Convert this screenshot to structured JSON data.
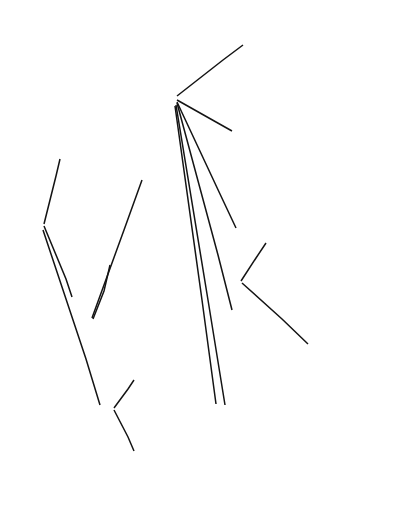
{
  "diagram": {
    "type": "tree-mindmap",
    "orientation": "rotated-90-ccw",
    "ink_color": "#141414",
    "background": "#ffffff"
  },
  "nodes": [
    {
      "id": "root",
      "name": "check-parity-root",
      "lines": [
        "CHECK PARITY"
      ],
      "x": 30,
      "y": 232,
      "align": "center",
      "style": "root"
    },
    {
      "id": "parity-note",
      "name": "parity-is-the-same-note",
      "lines": [
        "The parity is the same",
        "or not depending on",
        "whether the number of",
        "tile-swaps is even"
      ],
      "x": 63,
      "y": 178,
      "align": "center",
      "style": "plain"
    },
    {
      "id": "transform",
      "name": "transform-initial-into-goal",
      "lines": [
        "Transform",
        "the initial",
        "state into",
        "the goal state"
      ],
      "x": 79,
      "y": 330,
      "align": "center",
      "style": "plain"
    },
    {
      "id": "prepare",
      "name": "prepare-to-transform",
      "lines": [
        "Prepare to",
        "transform",
        "the initial",
        "state into the",
        "goal state"
      ],
      "x": 105,
      "y": 470,
      "align": "center",
      "style": "plain"
    },
    {
      "id": "zero-swaps",
      "name": "zero-tile-swaps-made",
      "lines": [
        "Zero tile-swaps",
        "have been made"
      ],
      "x": 130,
      "y": 378,
      "align": "center",
      "style": "plain"
    },
    {
      "id": "move-blank",
      "name": "move-the-blank",
      "lines": [
        "MOVE THE",
        "initial",
        "state's",
        "BLANK to",
        "the same",
        "position",
        "the blank",
        "occupies",
        "in the",
        "goal state"
      ],
      "x": 130,
      "y": 524,
      "align": "center",
      "style": "plain"
    },
    {
      "id": "for-each",
      "name": "for-each-row-and-column",
      "lines": [
        "For each row",
        "and column in",
        "the goal",
        "state"
      ],
      "x": 113,
      "y": 258,
      "align": "center",
      "style": "plain"
    },
    {
      "id": "tile-out-of-place",
      "name": "tile-out-of-place-question",
      "lines": [
        "Do we have",
        "a tile out",
        "of place at",
        "this position?"
      ],
      "x": 138,
      "y": 148,
      "align": "center",
      "style": "plain"
    },
    {
      "id": "add-one",
      "name": "add-one-to-number-of-swaps",
      "lines": [
        "Add 1 to",
        "number of",
        "swaps"
      ],
      "x": 249,
      "y": 73,
      "align": "center",
      "style": "plain"
    },
    {
      "id": "swap",
      "name": "swap-initial-state-cells",
      "lines": [
        "Swap",
        "initial state",
        "[row, column]",
        "with",
        "initial state",
        "[search row,",
        "search column]"
      ],
      "x": 202,
      "y": 155,
      "align": "center",
      "style": "plain"
    },
    {
      "id": "find-position",
      "name": "find-position-of-matching-tile",
      "lines": [
        "Find the",
        "position of",
        "the matching",
        "tile in the",
        "initial state"
      ],
      "x": 202,
      "y": 265,
      "align": "center",
      "style": "plain"
    },
    {
      "id": "advance",
      "name": "advance-to-next-position",
      "lines": [
        "ADVANCE to the",
        "next position in the",
        "initial state"
      ],
      "x": 263,
      "y": 228,
      "align": "center",
      "style": "plain"
    },
    {
      "id": "loop-until",
      "name": "loop-until-match-found",
      "lines": [
        "Loop until",
        "initial state",
        "[search row, search column]",
        "=",
        "goal state [row, column]"
      ],
      "x": 325,
      "y": 330,
      "align": "center",
      "style": "plain"
    },
    {
      "id": "start-search",
      "name": "start-the-search-row-and-column",
      "lines": [
        "Start the",
        "search row",
        "at row and",
        "search column",
        "at column"
      ],
      "x": 202,
      "y": 370,
      "align": "center",
      "style": "plain"
    },
    {
      "id": "if-not-equal",
      "name": "if-initial-state-not-equal-goal-state",
      "lines": [
        "If",
        "the initial state",
        "[row, column]",
        "is not equal to",
        "the goal state",
        "[row, column]",
        "then"
      ],
      "x": 224,
      "y": 524,
      "align": "center",
      "style": "plain"
    }
  ],
  "edges": [
    {
      "name": "edge-root-to-parity-note",
      "from": "root",
      "to": "parity-note",
      "path": "M 44 224 L 56 176 L 60 159"
    },
    {
      "name": "edge-root-to-transform",
      "from": "root",
      "to": "transform",
      "path": "M 44 226 L 66 279 L 72 297"
    },
    {
      "name": "edge-root-to-prepare",
      "from": "root",
      "to": "prepare",
      "path": "M 43 230 L 86 359 L 100 405"
    },
    {
      "name": "edge-transform-to-for-each",
      "from": "transform",
      "to": "for-each",
      "path": "M 93 319 L 104 291 L 110 265"
    },
    {
      "name": "edge-transform-to-tile",
      "from": "transform",
      "to": "tile-out-of-place",
      "path": "M 92 318 L 124 230 L 142 180"
    },
    {
      "name": "edge-prepare-to-zero",
      "from": "prepare",
      "to": "zero-swaps",
      "path": "M 114 408 L 128 389 L 134 380"
    },
    {
      "name": "edge-prepare-to-move",
      "from": "prepare",
      "to": "move-blank",
      "path": "M 114 410 L 128 437 L 134 451"
    },
    {
      "name": "edge-tile-to-add-one",
      "from": "tile-out-of-place",
      "to": "add-one",
      "path": "M 177 96 L 223 60 L 243 45"
    },
    {
      "name": "edge-tile-to-swap",
      "from": "tile-out-of-place",
      "to": "swap",
      "path": "M 177 100 L 216 122 L 232 131"
    },
    {
      "name": "edge-tile-to-find-position",
      "from": "tile-out-of-place",
      "to": "find-position",
      "path": "M 177 102 L 220 194 L 236 228"
    },
    {
      "name": "edge-tile-to-start-search",
      "from": "tile-out-of-place",
      "to": "start-search",
      "path": "M 177 103 L 218 255 L 232 310"
    },
    {
      "name": "edge-tile-to-if-not-equal-a",
      "from": "tile-out-of-place",
      "to": "if-not-equal",
      "path": "M 176 105 L 208 300 L 225 405"
    },
    {
      "name": "edge-tile-to-if-not-equal-b",
      "from": "tile-out-of-place",
      "to": "if-not-equal",
      "path": "M 175 106 L 202 300 L 216 404"
    },
    {
      "name": "edge-find-to-advance",
      "from": "find-position",
      "to": "advance",
      "path": "M 241 281 L 256 258 L 266 243"
    },
    {
      "name": "edge-find-to-loop-until",
      "from": "find-position",
      "to": "loop-until",
      "path": "M 242 283 L 282 319 L 308 344"
    }
  ]
}
